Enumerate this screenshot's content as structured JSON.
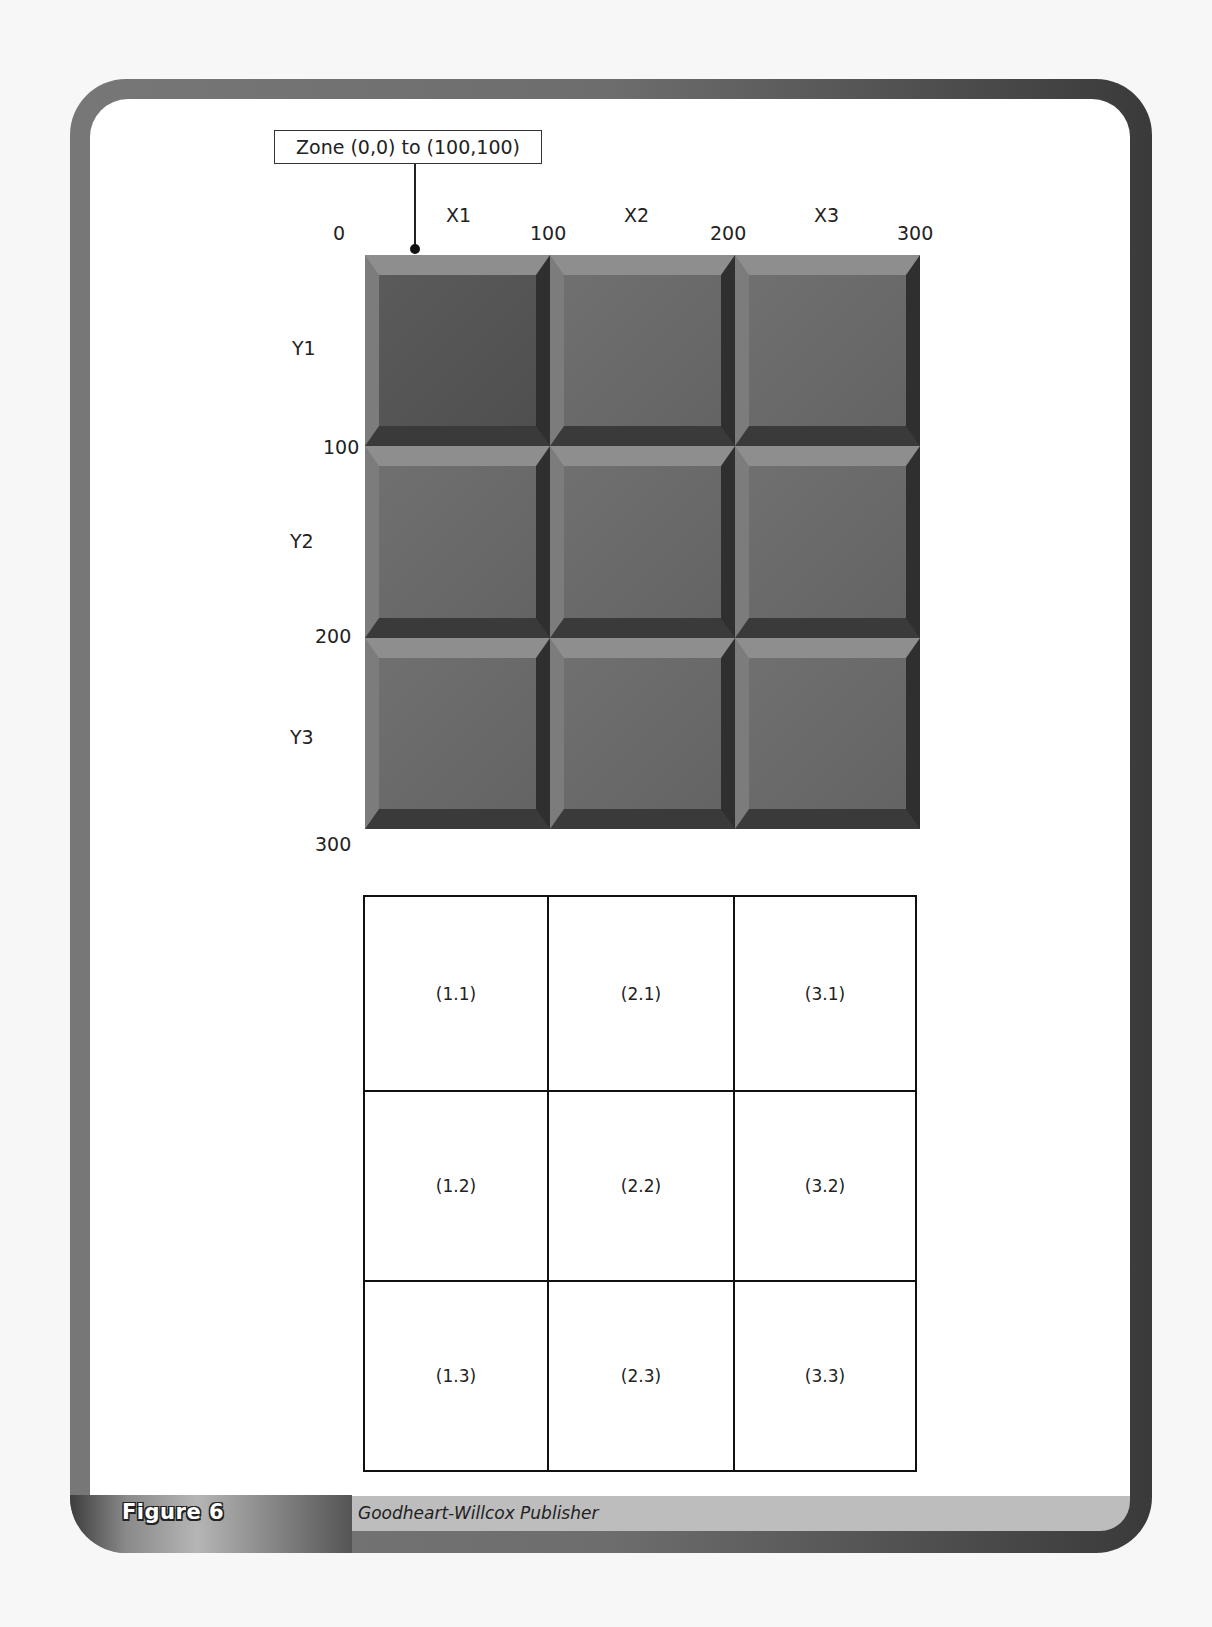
{
  "callout": {
    "text": "Zone (0,0) to (100,100)"
  },
  "x_axis": {
    "ticks": [
      "0",
      "100",
      "200",
      "300"
    ],
    "columns": [
      "X1",
      "X2",
      "X3"
    ]
  },
  "y_axis": {
    "ticks": [
      "100",
      "200",
      "300"
    ],
    "rows": [
      "Y1",
      "Y2",
      "Y3"
    ]
  },
  "grid": {
    "rows": 3,
    "cols": 3,
    "tile_color": "#6a6a6a",
    "highlighted_tile": "X1,Y1"
  },
  "table": {
    "rows": [
      [
        "(1.1)",
        "(2.1)",
        "(3.1)"
      ],
      [
        "(1.2)",
        "(2.2)",
        "(3.2)"
      ],
      [
        "(1.3)",
        "(2.3)",
        "(3.3)"
      ]
    ]
  },
  "footer": {
    "figure_label": "Figure 6",
    "credit": "Goodheart-Willcox Publisher"
  }
}
